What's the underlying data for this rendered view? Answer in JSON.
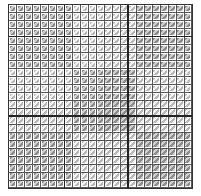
{
  "grid": {
    "rows": 23,
    "cols": 23,
    "cell_size_px": 8,
    "block_rows": 3,
    "block_cols": 3,
    "thick_lines": {
      "horizontal_at_rows": [
        4,
        14
      ],
      "vertical_at_cols": [
        7,
        15
      ]
    }
  },
  "shading": {
    "dark_blocks": [
      [
        0,
        0
      ],
      [
        0,
        2
      ],
      [
        1,
        1
      ],
      [
        2,
        0
      ],
      [
        2,
        2
      ]
    ],
    "light_blocks": [
      [
        0,
        1
      ],
      [
        1,
        0
      ],
      [
        1,
        2
      ],
      [
        2,
        1
      ]
    ],
    "colors": {
      "dark_hatch": "#8a8a8a",
      "dark_bg": "#cfcfcf",
      "light_hatch": "#b8b8b8",
      "light_bg": "#f2f2f2",
      "grid_line": "#555555",
      "thick_line": "#222222"
    }
  }
}
